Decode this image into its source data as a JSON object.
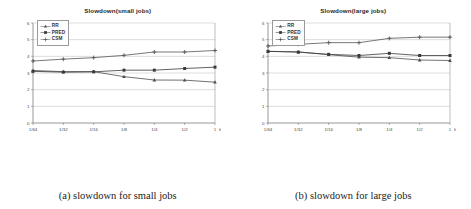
{
  "figure": {
    "panels": [
      {
        "caption": "(a) slowdown for small jobs",
        "chart_data": {
          "type": "line",
          "title": "Slowdown(small jobs)",
          "xlabel": "freq(mes/s)",
          "ylabel": "",
          "categories": [
            "1/64",
            "1/32",
            "1/16",
            "1/8",
            "1/4",
            "1/2",
            "1"
          ],
          "ylim": [
            0,
            6
          ],
          "yticks": [
            0,
            1,
            2,
            3,
            4,
            5,
            6
          ],
          "grid": true,
          "legend_position": "upper-left",
          "series": [
            {
              "name": "RR",
              "values": [
                3.15,
                3.08,
                3.08,
                2.78,
                2.58,
                2.57,
                2.45
              ],
              "color": "#4d4d4d",
              "marker": "triangle"
            },
            {
              "name": "PRED",
              "values": [
                3.1,
                3.05,
                3.07,
                3.17,
                3.17,
                3.27,
                3.35
              ],
              "color": "#3a3a3a",
              "marker": "square"
            },
            {
              "name": "CSM",
              "values": [
                3.72,
                3.83,
                3.92,
                4.06,
                4.26,
                4.26,
                4.35
              ],
              "color": "#555555",
              "marker": "plus"
            }
          ]
        }
      },
      {
        "caption": "(b) slowdown for large jobs",
        "chart_data": {
          "type": "line",
          "title": "Slowdown(large jobs)",
          "xlabel": "freq(mes/s)",
          "ylabel": "",
          "categories": [
            "1/64",
            "1/32",
            "1/16",
            "1/8",
            "1/4",
            "1/2",
            "1"
          ],
          "ylim": [
            0,
            6
          ],
          "yticks": [
            0,
            1,
            2,
            3,
            4,
            5,
            6
          ],
          "grid": true,
          "legend_position": "upper-left",
          "series": [
            {
              "name": "RR",
              "values": [
                4.3,
                4.27,
                4.1,
                3.95,
                3.92,
                3.78,
                3.75
              ],
              "color": "#4d4d4d",
              "marker": "triangle"
            },
            {
              "name": "PRED",
              "values": [
                4.3,
                4.25,
                4.12,
                4.05,
                4.18,
                4.05,
                4.05
              ],
              "color": "#3a3a3a",
              "marker": "square"
            },
            {
              "name": "CSM",
              "values": [
                4.62,
                4.72,
                4.82,
                4.82,
                5.08,
                5.15,
                5.15
              ],
              "color": "#555555",
              "marker": "plus"
            }
          ]
        }
      }
    ],
    "axis_color": "#7d7d7d",
    "grid_color": "#b9b9b9",
    "tick_font_size": 4.4
  }
}
